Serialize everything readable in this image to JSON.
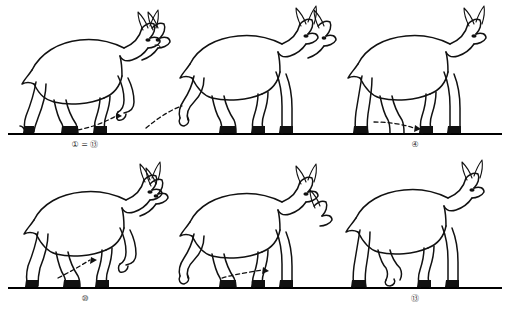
{
  "figure": {
    "background_color": "#ffffff",
    "ink_color": "#111111",
    "ground_line_color": "#000000"
  },
  "rows": [
    {
      "name": "top-row",
      "panels": [
        {
          "caption": "① = ⑬",
          "frame_numbers": [
            1,
            13
          ],
          "annotation": "dashed-arc-trajectory"
        },
        {
          "caption": "④",
          "frame_numbers": [
            4
          ],
          "annotation": "dashed-arc-trajectory"
        },
        {
          "caption": "⑦",
          "frame_numbers": [
            7
          ],
          "annotation": "dashed-arc-arrow"
        }
      ]
    },
    {
      "name": "bottom-row",
      "panels": [
        {
          "caption": "⑩",
          "frame_numbers": [
            10
          ],
          "annotation": "dashed-arrow-up-right"
        },
        {
          "caption": "⑬",
          "frame_numbers": [
            13
          ],
          "annotation": "dashed-arrow-up-right"
        },
        {
          "caption": "⑯",
          "frame_numbers": [
            16
          ],
          "annotation": "none"
        }
      ]
    }
  ]
}
